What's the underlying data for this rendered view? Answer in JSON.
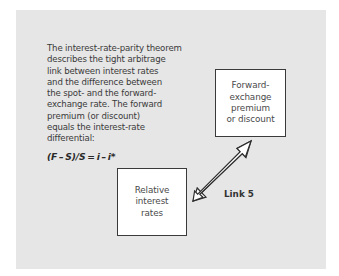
{
  "description": {
    "text": "The interest-rate-parity theorem\ndescribes the tight arbitrage\nlink between interest rates\nand the difference between\nthe spot- and the forward-\nexchange rate. The forward\npremium (or discount)\nequals the interest-rate\ndifferential:",
    "formula": "(F – S)/S = i – i*"
  },
  "nodes": [
    {
      "id": "forward",
      "label": "Forward-\nexchange\npremium\nor discount"
    },
    {
      "id": "relative",
      "label": "Relative\ninterest\nrates"
    }
  ],
  "link": {
    "label": "Link 5",
    "from": "relative",
    "to": "forward",
    "type": "double-headed-arrow"
  },
  "colors": {
    "panel_background": "#e6e6e6",
    "box_background": "#ffffff",
    "box_border": "#3a3a3a",
    "text": "#3a3a3a"
  }
}
